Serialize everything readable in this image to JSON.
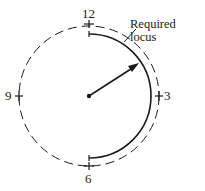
{
  "diagram": {
    "labels": {
      "twelve": "12",
      "three": "3",
      "six": "6",
      "nine": "9",
      "callout": "Required locus"
    },
    "colors": {
      "stroke": "#1a1a1a",
      "background": "#ffffff"
    }
  }
}
